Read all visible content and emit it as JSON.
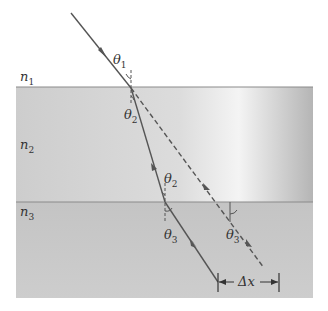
{
  "diagram": {
    "type": "refraction-through-layers",
    "layers": [
      {
        "label": "n",
        "sub": "1",
        "name": "medium-1"
      },
      {
        "label": "n",
        "sub": "2",
        "name": "medium-2"
      },
      {
        "label": "n",
        "sub": "3",
        "name": "medium-3"
      }
    ],
    "angles": {
      "theta1": {
        "sym": "θ",
        "sub": "1"
      },
      "theta2a": {
        "sym": "θ",
        "sub": "2"
      },
      "theta2b": {
        "sym": "θ",
        "sub": "2"
      },
      "theta3a": {
        "sym": "θ",
        "sub": "3"
      },
      "theta3b": {
        "sym": "θ",
        "sub": "3"
      }
    },
    "displacement_label": "Δx",
    "colors": {
      "ray": "#555555",
      "interface": "#8a8a8a",
      "layer2": "#cfcfcf",
      "layer3": "#c6c6c6"
    }
  }
}
